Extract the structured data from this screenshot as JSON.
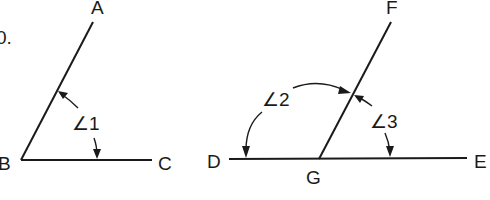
{
  "figure": {
    "fragment_label": "0.",
    "left_angle": {
      "points": {
        "A": "A",
        "B": "B",
        "C": "C"
      },
      "angle_label": "∠1"
    },
    "right_angles": {
      "points": {
        "D": "D",
        "E": "E",
        "F": "F",
        "G": "G"
      },
      "angle_2_label": "∠2",
      "angle_3_label": "∠3"
    },
    "colors": {
      "stroke": "#1a1a1a",
      "background": "#ffffff"
    }
  }
}
